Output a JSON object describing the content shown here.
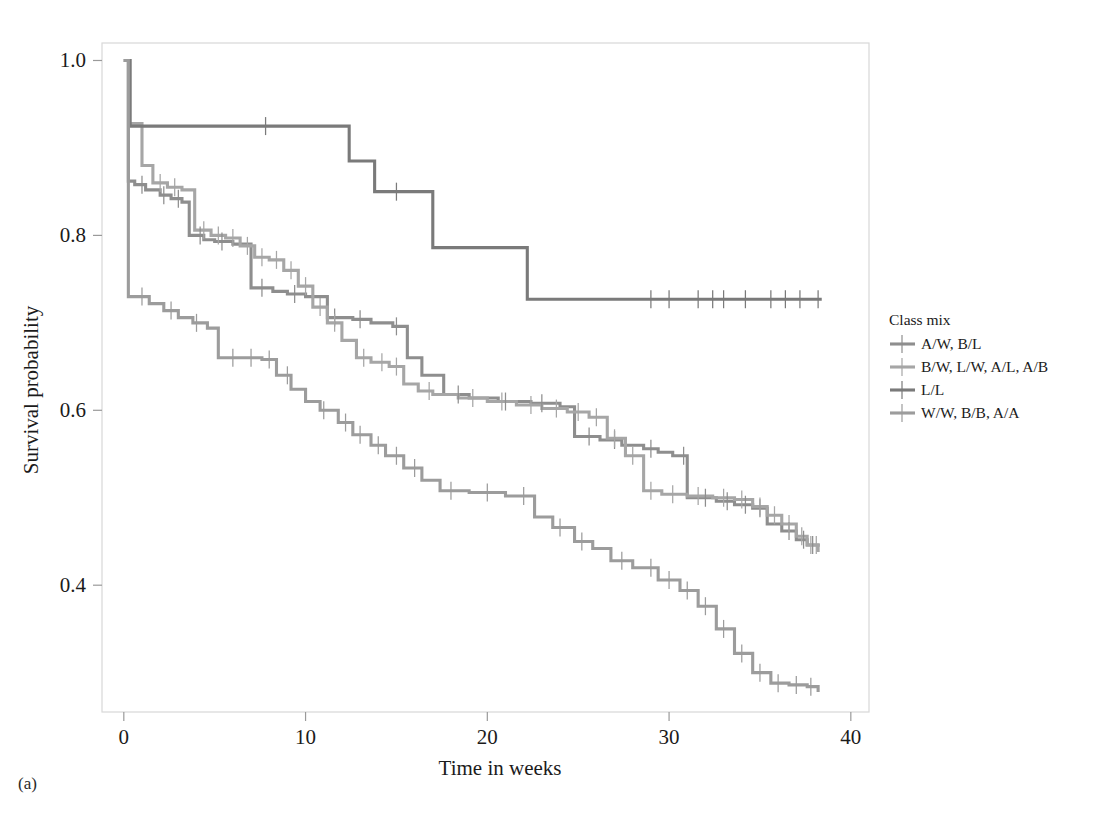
{
  "figure": {
    "caption": "(a)",
    "background_color": "#ffffff"
  },
  "chart_data": {
    "type": "line",
    "subtype": "kaplan-meier-step",
    "title": "",
    "xlabel": "Time in weeks",
    "ylabel": "Survival probability",
    "xlim": [
      -1.2,
      41.0
    ],
    "ylim": [
      0.255,
      1.02
    ],
    "xticks": [
      0,
      10,
      20,
      30,
      40
    ],
    "xtick_labels": [
      "0",
      "10",
      "20",
      "30",
      "40"
    ],
    "yticks": [
      0.4,
      0.6,
      0.8,
      1.0
    ],
    "ytick_labels": [
      "0.4",
      "0.6",
      "0.8",
      "1.0"
    ],
    "grid": false,
    "legend": {
      "title": "Class mix",
      "position": "right-outside",
      "entries": [
        {
          "label": "A/W, B/L",
          "color": "#8e8e8e"
        },
        {
          "label": "B/W, L/W, A/L, A/B",
          "color": "#a6a6a6"
        },
        {
          "label": "L/L",
          "color": "#7a7a7a"
        },
        {
          "label": "W/W, B/B, A/A",
          "color": "#9c9c9c"
        }
      ]
    },
    "series": [
      {
        "name": "A/W, B/L",
        "color": "#8e8e8e",
        "points": [
          [
            0.0,
            1.0
          ],
          [
            0.25,
            0.862
          ],
          [
            0.6,
            0.858
          ],
          [
            1.2,
            0.852
          ],
          [
            2.0,
            0.846
          ],
          [
            2.6,
            0.842
          ],
          [
            3.2,
            0.838
          ],
          [
            3.6,
            0.8
          ],
          [
            4.4,
            0.795
          ],
          [
            5.0,
            0.793
          ],
          [
            6.0,
            0.79
          ],
          [
            7.0,
            0.74
          ],
          [
            8.2,
            0.736
          ],
          [
            9.0,
            0.733
          ],
          [
            10.0,
            0.73
          ],
          [
            11.2,
            0.706
          ],
          [
            12.6,
            0.704
          ],
          [
            13.6,
            0.7
          ],
          [
            14.8,
            0.696
          ],
          [
            15.6,
            0.66
          ],
          [
            16.4,
            0.64
          ],
          [
            17.6,
            0.618
          ],
          [
            19.0,
            0.614
          ],
          [
            20.6,
            0.61
          ],
          [
            22.4,
            0.608
          ],
          [
            24.0,
            0.604
          ],
          [
            24.8,
            0.57
          ],
          [
            26.2,
            0.566
          ],
          [
            27.4,
            0.56
          ],
          [
            28.6,
            0.556
          ],
          [
            29.4,
            0.552
          ],
          [
            30.2,
            0.548
          ],
          [
            31.0,
            0.5
          ],
          [
            32.6,
            0.496
          ],
          [
            33.6,
            0.492
          ],
          [
            34.6,
            0.488
          ],
          [
            35.4,
            0.47
          ],
          [
            36.2,
            0.462
          ],
          [
            37.0,
            0.452
          ],
          [
            37.6,
            0.446
          ],
          [
            38.2,
            0.444
          ]
        ],
        "censor_times": [
          1.0,
          2.2,
          3.0,
          4.2,
          5.4,
          7.6,
          9.4,
          11.6,
          13.0,
          15.0,
          18.4,
          21.0,
          23.0,
          25.6,
          27.0,
          29.0,
          30.8,
          32.0,
          33.2,
          34.2,
          35.0,
          36.6,
          37.4,
          37.9
        ]
      },
      {
        "name": "B/W, L/W, A/L, A/B",
        "color": "#a6a6a6",
        "points": [
          [
            0.0,
            1.0
          ],
          [
            0.3,
            0.928
          ],
          [
            1.0,
            0.88
          ],
          [
            1.6,
            0.86
          ],
          [
            2.4,
            0.855
          ],
          [
            3.2,
            0.852
          ],
          [
            3.9,
            0.806
          ],
          [
            4.8,
            0.8
          ],
          [
            5.6,
            0.797
          ],
          [
            6.4,
            0.788
          ],
          [
            7.2,
            0.775
          ],
          [
            8.0,
            0.772
          ],
          [
            8.8,
            0.76
          ],
          [
            9.6,
            0.742
          ],
          [
            10.4,
            0.718
          ],
          [
            11.2,
            0.7
          ],
          [
            12.0,
            0.68
          ],
          [
            12.8,
            0.66
          ],
          [
            13.6,
            0.655
          ],
          [
            14.6,
            0.65
          ],
          [
            15.4,
            0.63
          ],
          [
            16.2,
            0.622
          ],
          [
            17.0,
            0.618
          ],
          [
            18.4,
            0.614
          ],
          [
            20.0,
            0.61
          ],
          [
            21.6,
            0.606
          ],
          [
            23.0,
            0.602
          ],
          [
            24.4,
            0.598
          ],
          [
            25.6,
            0.592
          ],
          [
            26.6,
            0.568
          ],
          [
            27.6,
            0.548
          ],
          [
            28.6,
            0.508
          ],
          [
            29.6,
            0.504
          ],
          [
            31.0,
            0.502
          ],
          [
            32.4,
            0.5
          ],
          [
            33.6,
            0.498
          ],
          [
            34.6,
            0.49
          ],
          [
            35.4,
            0.48
          ],
          [
            36.2,
            0.47
          ],
          [
            37.0,
            0.456
          ],
          [
            37.6,
            0.446
          ],
          [
            38.2,
            0.438
          ]
        ],
        "censor_times": [
          2.0,
          2.8,
          4.4,
          5.2,
          6.0,
          6.8,
          7.6,
          8.4,
          9.2,
          10.0,
          10.8,
          11.6,
          13.2,
          14.2,
          15.0,
          16.8,
          19.2,
          20.8,
          22.4,
          23.8,
          25.0,
          26.0,
          27.0,
          28.0,
          29.0,
          30.2,
          31.6,
          33.0,
          34.0,
          35.0,
          35.8,
          36.6,
          37.3,
          37.8,
          38.1
        ]
      },
      {
        "name": "L/L",
        "color": "#7a7a7a",
        "points": [
          [
            0.0,
            1.0
          ],
          [
            0.35,
            0.925
          ],
          [
            12.0,
            0.925
          ],
          [
            12.4,
            0.885
          ],
          [
            13.4,
            0.885
          ],
          [
            13.8,
            0.85
          ],
          [
            16.6,
            0.85
          ],
          [
            17.0,
            0.786
          ],
          [
            21.8,
            0.786
          ],
          [
            22.2,
            0.727
          ],
          [
            38.4,
            0.727
          ]
        ],
        "censor_times": [
          7.8,
          15.0,
          29.0,
          30.0,
          31.6,
          32.4,
          33.0,
          34.2,
          35.6,
          36.4,
          37.2,
          38.2
        ]
      },
      {
        "name": "W/W, B/B, A/A",
        "color": "#9c9c9c",
        "points": [
          [
            0.0,
            1.0
          ],
          [
            0.25,
            0.73
          ],
          [
            1.4,
            0.722
          ],
          [
            2.2,
            0.714
          ],
          [
            3.0,
            0.706
          ],
          [
            3.8,
            0.7
          ],
          [
            4.6,
            0.694
          ],
          [
            5.2,
            0.66
          ],
          [
            7.6,
            0.658
          ],
          [
            8.4,
            0.64
          ],
          [
            9.2,
            0.624
          ],
          [
            10.0,
            0.61
          ],
          [
            10.8,
            0.6
          ],
          [
            11.8,
            0.586
          ],
          [
            12.6,
            0.572
          ],
          [
            13.6,
            0.56
          ],
          [
            14.4,
            0.548
          ],
          [
            15.4,
            0.534
          ],
          [
            16.4,
            0.52
          ],
          [
            17.4,
            0.508
          ],
          [
            19.0,
            0.506
          ],
          [
            21.0,
            0.502
          ],
          [
            22.6,
            0.478
          ],
          [
            23.6,
            0.466
          ],
          [
            24.8,
            0.45
          ],
          [
            25.8,
            0.442
          ],
          [
            26.8,
            0.428
          ],
          [
            28.0,
            0.42
          ],
          [
            29.4,
            0.406
          ],
          [
            30.6,
            0.394
          ],
          [
            31.6,
            0.376
          ],
          [
            32.6,
            0.35
          ],
          [
            33.6,
            0.322
          ],
          [
            34.6,
            0.3
          ],
          [
            35.6,
            0.288
          ],
          [
            36.6,
            0.286
          ],
          [
            37.6,
            0.284
          ],
          [
            38.2,
            0.278
          ]
        ],
        "censor_times": [
          1.0,
          2.6,
          4.0,
          6.0,
          7.0,
          8.0,
          9.0,
          11.0,
          12.2,
          13.0,
          14.0,
          15.0,
          16.0,
          18.0,
          20.0,
          22.0,
          24.0,
          25.2,
          27.4,
          29.0,
          30.0,
          31.0,
          32.0,
          33.0,
          34.0,
          35.0,
          36.0,
          37.0,
          37.8
        ]
      }
    ]
  }
}
